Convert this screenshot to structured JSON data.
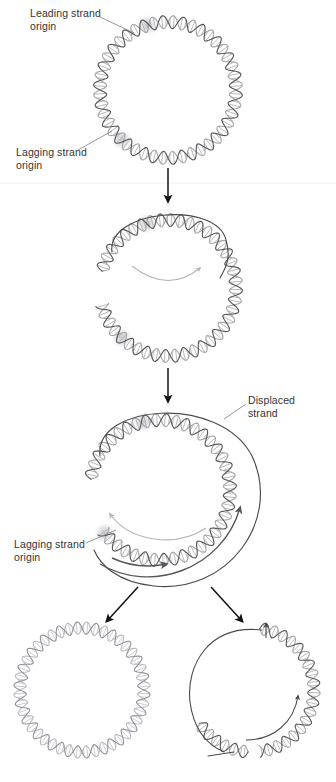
{
  "figure": {
    "background": "#ffffff",
    "width": 336,
    "height": 782
  },
  "labels": {
    "leading_strand_origin": "Leading strand\norigin",
    "lagging_strand_origin_stage1": "Lagging strand\norigin",
    "displaced_strand": "Displaced\nstrand",
    "lagging_strand_origin_stage3": "Lagging strand\norigin"
  },
  "colors": {
    "text": "#333333",
    "leader_line": "#8a8a8a",
    "helix_dark": "#59595c",
    "helix_light": "#a8a8ac",
    "single_strand": "#4a4a4d",
    "flow_arrow_dark": "#55555a",
    "flow_arrow_light": "#b5b5ba",
    "step_arrow": "#111111",
    "origin_glow": "#b9b9be",
    "divider": "#ededed"
  },
  "stages": [
    {
      "id": "stage-1",
      "name": "closed-circular-duplex",
      "caption": "Double-stranded circular DNA with leading and lagging strand origins marked",
      "center": [
        168,
        90
      ],
      "radius": 68,
      "origins": [
        {
          "name": "leading-strand-origin",
          "angle_deg": -108
        },
        {
          "name": "lagging-strand-origin",
          "angle_deg": 133
        }
      ]
    },
    {
      "id": "stage-2",
      "name": "nicked-strand-displacement-begins",
      "caption": "Leading strand synthesis displaces the nicked strand as a small loop",
      "center": [
        168,
        288
      ],
      "radius": 68,
      "displaced_loop": "small top loop",
      "direction_arrow": "clockwise interior arc"
    },
    {
      "id": "stage-3",
      "name": "rolling-circle-extended-tail",
      "caption": "Displaced strand extends around the circle while lagging strand synthesis starts",
      "center": [
        160,
        490
      ],
      "radius": 70,
      "displaced_loop": "large right-hand loop",
      "direction_arrows": [
        "outer clockwise",
        "inner lagging",
        "interior light arc"
      ]
    },
    {
      "id": "stage-4-left",
      "name": "product-circular-duplex",
      "caption": "Product: intact double-stranded circle",
      "center": [
        82,
        690
      ],
      "radius": 62
    },
    {
      "id": "stage-4-right",
      "name": "product-partially-replicated-circle",
      "caption": "Product: circle with newly synthesized duplex region",
      "center": [
        252,
        690
      ],
      "radius": 62
    }
  ],
  "step_arrows": [
    {
      "name": "arrow-stage1-to-stage2",
      "from": [
        168,
        168
      ],
      "to": [
        168,
        200
      ],
      "type": "vertical"
    },
    {
      "name": "arrow-stage2-to-stage3",
      "from": [
        168,
        368
      ],
      "to": [
        168,
        400
      ],
      "type": "vertical"
    },
    {
      "name": "arrow-stage3-to-product-left",
      "from": [
        137,
        586
      ],
      "to": [
        104,
        622
      ],
      "type": "diagonal-left"
    },
    {
      "name": "arrow-stage3-to-product-right",
      "from": [
        212,
        586
      ],
      "to": [
        245,
        622
      ],
      "type": "diagonal-right"
    }
  ]
}
